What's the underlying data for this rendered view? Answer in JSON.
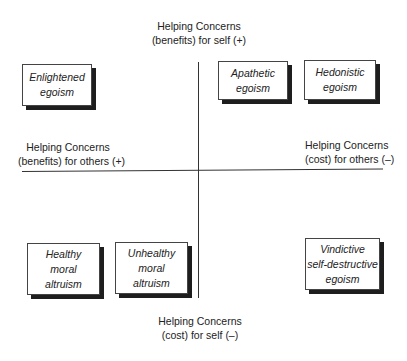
{
  "axes": {
    "top": {
      "line1": "Helping Concerns",
      "line2": "(benefits) for self (+)"
    },
    "bottom": {
      "line1": "Helping Concerns",
      "line2": "(cost) for self (–)"
    },
    "left": {
      "line1": "Helping Concerns",
      "line2": "(benefits) for others (+)"
    },
    "right": {
      "line1": "Helping Concerns",
      "line2": "(cost) for others (–)"
    }
  },
  "boxes": {
    "enlightened_egoism": [
      "Enlightened",
      "egoism"
    ],
    "apathetic_egoism": [
      "Apathetic",
      "egoism"
    ],
    "hedonistic_egoism": [
      "Hedonistic",
      "egoism"
    ],
    "healthy_moral_altruism": [
      "Healthy",
      "moral",
      "altruism"
    ],
    "unhealthy_moral_altruism": [
      "Unhealthy",
      "moral",
      "altruism"
    ],
    "vindictive_self_destructive_egoism": [
      "Vindictive",
      "self-destructive",
      "egoism"
    ]
  }
}
